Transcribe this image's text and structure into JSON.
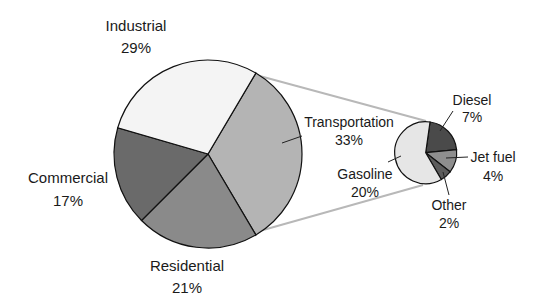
{
  "chart_data": {
    "type": "pie",
    "title": "",
    "subtype": "pie-of-pie",
    "main_pie": {
      "categories": [
        "Transportation",
        "Residential",
        "Commercial",
        "Industrial"
      ],
      "values": [
        33,
        21,
        17,
        29
      ],
      "labels": [
        "33%",
        "21%",
        "17%",
        "29%"
      ],
      "colors": [
        "#b4b4b4",
        "#8a8a8a",
        "#6a6a6a",
        "#f4f4f4"
      ]
    },
    "secondary_pie": {
      "parent": "Transportation",
      "categories": [
        "Diesel",
        "Jet fuel",
        "Other",
        "Gasoline"
      ],
      "values": [
        7,
        4,
        2,
        20
      ],
      "labels": [
        "7%",
        "4%",
        "2%",
        "20%"
      ],
      "colors": [
        "#4a4a4a",
        "#8e8e8e",
        "#5c5c5c",
        "#e6e6e6"
      ]
    },
    "legend": "none",
    "units": "%"
  },
  "labels": {
    "industrial": {
      "name": "Industrial",
      "value": "29%"
    },
    "commercial": {
      "name": "Commercial",
      "value": "17%"
    },
    "residential": {
      "name": "Residential",
      "value": "21%"
    },
    "transportation": {
      "name": "Transportation",
      "value": "33%"
    },
    "diesel": {
      "name": "Diesel",
      "value": "7%"
    },
    "jet_fuel": {
      "name": "Jet fuel",
      "value": "4%"
    },
    "other": {
      "name": "Other",
      "value": "2%"
    },
    "gasoline": {
      "name": "Gasoline",
      "value": "20%"
    }
  }
}
